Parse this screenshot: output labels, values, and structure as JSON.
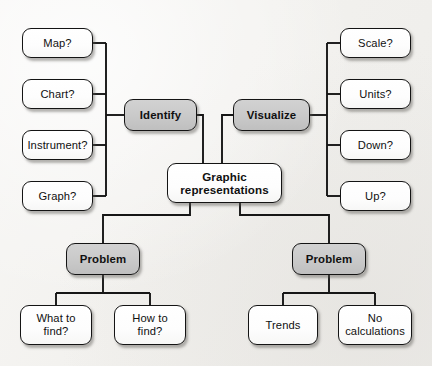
{
  "diagram": {
    "type": "concept-map",
    "title_node": "Graphic representations",
    "background_color": "#f6f5f3",
    "branch_fill_color": "#c9c9c9",
    "leaf_fill_color": "#ffffff",
    "stroke_color": "#141414",
    "nodes": {
      "hub": {
        "line1": "Graphic",
        "line2": "representations"
      },
      "identify": {
        "label": "Identify"
      },
      "visualize": {
        "label": "Visualize"
      },
      "problem_left": {
        "label": "Problem"
      },
      "problem_right": {
        "label": "Problem"
      },
      "map": {
        "label": "Map?"
      },
      "chart": {
        "label": "Chart?"
      },
      "instrument": {
        "label": "Instrument?"
      },
      "graph": {
        "label": "Graph?"
      },
      "scale": {
        "label": "Scale?"
      },
      "units": {
        "label": "Units?"
      },
      "down": {
        "label": "Down?"
      },
      "up": {
        "label": "Up?"
      },
      "what_to_find": {
        "line1": "What to",
        "line2": "find?"
      },
      "how_to_find": {
        "line1": "How to",
        "line2": "find?"
      },
      "trends": {
        "label": "Trends"
      },
      "no_calculations": {
        "line1": "No",
        "line2": "calculations"
      }
    }
  }
}
